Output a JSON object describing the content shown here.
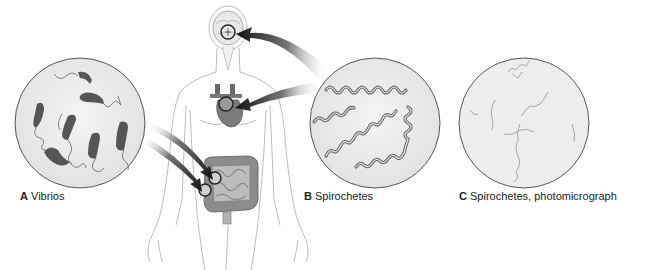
{
  "panels": [
    {
      "letter": "A",
      "name": "Vibrios"
    },
    {
      "letter": "B",
      "name": "Spirochetes"
    },
    {
      "letter": "C",
      "name": "Spirochetes, photomicrograph"
    }
  ],
  "colors": {
    "bacteria": "#4a4a4a",
    "circle_fill": "#ececec",
    "circle_stroke": "#555555",
    "body_stroke": "#bdbdbd",
    "organ": "#8a8a8a",
    "arrow": "#111111"
  }
}
